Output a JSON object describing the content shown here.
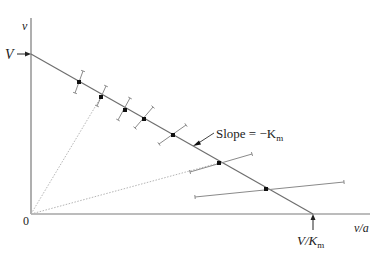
{
  "diagram": {
    "title": "",
    "type": "Eadie-Hofstee-style plot with error bars",
    "y_axis": {
      "label": "v"
    },
    "x_axis": {
      "label": "v/a"
    },
    "origin_label": "0",
    "y_intercept_label": "V",
    "x_intercept_label_main": "V/K",
    "x_intercept_label_sub": "m",
    "slope_label_main": "Slope = −K",
    "slope_label_sub": "m",
    "colors": {
      "axis": "#7a7a7a",
      "line": "#6e6e6e",
      "point": "#111111",
      "errorbar": "#8a8a8a",
      "dotted": "#b5b5b5",
      "text": "#222222"
    }
  },
  "chart_data": {
    "type": "scatter",
    "title": "",
    "xlabel": "v/a",
    "ylabel": "v",
    "fit_line": {
      "from": "V (y-intercept)",
      "to": "V/Km (x-intercept)",
      "slope_label": "Slope = −Km"
    },
    "points_pixel": [
      {
        "x": 79,
        "y": 82,
        "err_from": [
          75,
          93
        ],
        "err_to": [
          83,
          71
        ]
      },
      {
        "x": 101,
        "y": 97,
        "err_from": [
          97,
          106
        ],
        "err_to": [
          106,
          86
        ]
      },
      {
        "x": 125,
        "y": 110,
        "err_from": [
          118,
          120
        ],
        "err_to": [
          130,
          98
        ]
      },
      {
        "x": 144,
        "y": 119,
        "err_from": [
          135,
          128
        ],
        "err_to": [
          153,
          107
        ]
      },
      {
        "x": 173,
        "y": 135,
        "err_from": [
          159,
          144
        ],
        "err_to": [
          186,
          125
        ]
      },
      {
        "x": 219,
        "y": 163,
        "err_from": [
          190,
          172
        ],
        "err_to": [
          252,
          154
        ]
      },
      {
        "x": 266,
        "y": 189,
        "err_from": [
          195,
          197
        ],
        "err_to": [
          344,
          182
        ]
      }
    ],
    "dotted_rays_from_origin_to": [
      [
        101,
        97
      ],
      [
        219,
        163
      ]
    ],
    "grid": false,
    "legend": "none"
  }
}
